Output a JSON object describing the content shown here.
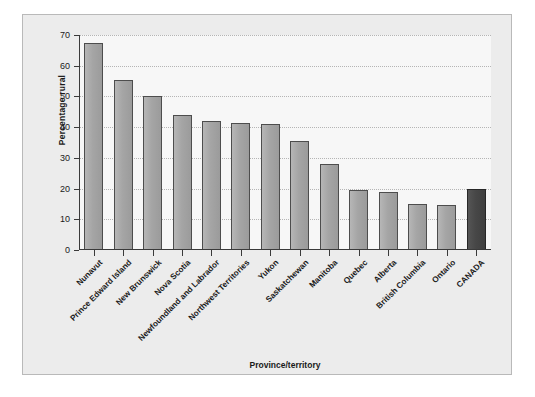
{
  "chart_data": {
    "type": "bar",
    "title": "",
    "xlabel": "Province/territory",
    "ylabel": "Percentage rural",
    "ylim": [
      0,
      70
    ],
    "yticks": [
      0,
      10,
      20,
      30,
      40,
      50,
      60,
      70
    ],
    "grid": true,
    "legend": "none",
    "categories": [
      "Nunavut",
      "Prince Edward Island",
      "New Brunswick",
      "Nova Scotia",
      "Newfoundland and Labrador",
      "Northwest Territories",
      "Yukon",
      "Saskatchewan",
      "Manitoba",
      "Quebec",
      "Alberta",
      "British Columbia",
      "Ontario",
      "CANADA"
    ],
    "values": [
      67.5,
      55.5,
      50,
      44,
      42,
      41.5,
      41,
      35.5,
      28,
      19.5,
      19,
      15,
      14.8,
      20
    ],
    "highlight_index": 13,
    "colors": {
      "bar": "#a5a5a5",
      "bar_highlight": "#474747",
      "bar_border": "#4d4d4d",
      "plot_background": "#f7f7f7",
      "panel_background": "#ececec",
      "gridline": "#b5b5b5",
      "axis": "#3a3a3a",
      "text": "#1a1a1a"
    }
  }
}
